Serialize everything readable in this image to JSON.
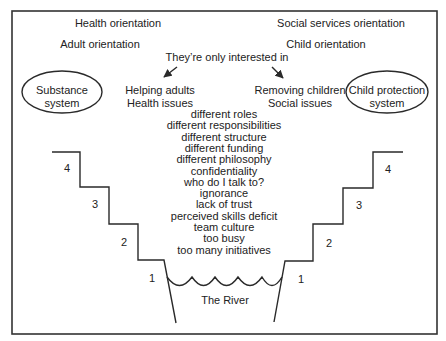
{
  "colors": {
    "line": "#2a2a2a",
    "text": "#222222",
    "background": "#ffffff"
  },
  "orientations": {
    "left_top": "Health orientation",
    "right_top": "Social services orientation",
    "left": "Adult orientation",
    "right": "Child orientation"
  },
  "connector": {
    "label": "They’re only interested in"
  },
  "left_focus": {
    "line1": "Helping adults",
    "line2": "Health issues"
  },
  "right_focus": {
    "line1": "Removing children",
    "line2": "Social issues"
  },
  "systems": {
    "left": {
      "line1": "Substance",
      "line2": "system"
    },
    "right": {
      "line1": "Child protection",
      "line2": "system"
    }
  },
  "barriers": [
    "different roles",
    "different responsibilities",
    "different structure",
    "different funding",
    "different philosophy",
    "confidentiality",
    "who do I talk to?",
    "ignorance",
    "lack of trust",
    "perceived skills deficit",
    "team culture",
    "too busy",
    "too many initiatives"
  ],
  "steps": {
    "left": [
      "4",
      "3",
      "2",
      "1"
    ],
    "right": [
      "4",
      "3",
      "2",
      "1"
    ]
  },
  "river": {
    "label": "The River"
  }
}
